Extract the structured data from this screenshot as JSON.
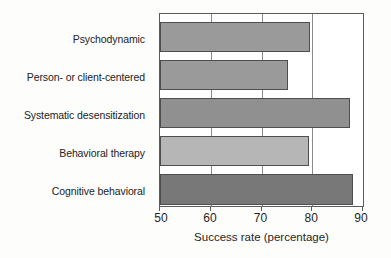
{
  "chart_data": {
    "type": "bar",
    "orientation": "horizontal",
    "title": "",
    "xlabel": "Success rate (percentage)",
    "ylabel": "",
    "xlim": [
      50,
      90
    ],
    "ylim": null,
    "grid": true,
    "legend": false,
    "xticks": [
      50,
      60,
      70,
      80,
      90
    ],
    "xtick_labels": [
      "50",
      "60",
      "70",
      "80",
      "90"
    ],
    "categories": [
      "Psychodynamic",
      "Person- or client-centered",
      "Systematic desensitization",
      "Behavioral therapy",
      "Cognitive behavioral"
    ],
    "values": [
      79.6,
      75.3,
      87.4,
      79.4,
      88.0
    ],
    "bar_colors": [
      "#9a9a9a",
      "#9a9a9a",
      "#909090",
      "#b6b6b6",
      "#787878"
    ],
    "bar_edge_color": "#4e4e4e",
    "frame_color": "#5b5b5b",
    "grid_color": "#8a8a8a",
    "background": "#ffffff"
  },
  "axis": {
    "x_title": "Success rate (percentage)"
  }
}
